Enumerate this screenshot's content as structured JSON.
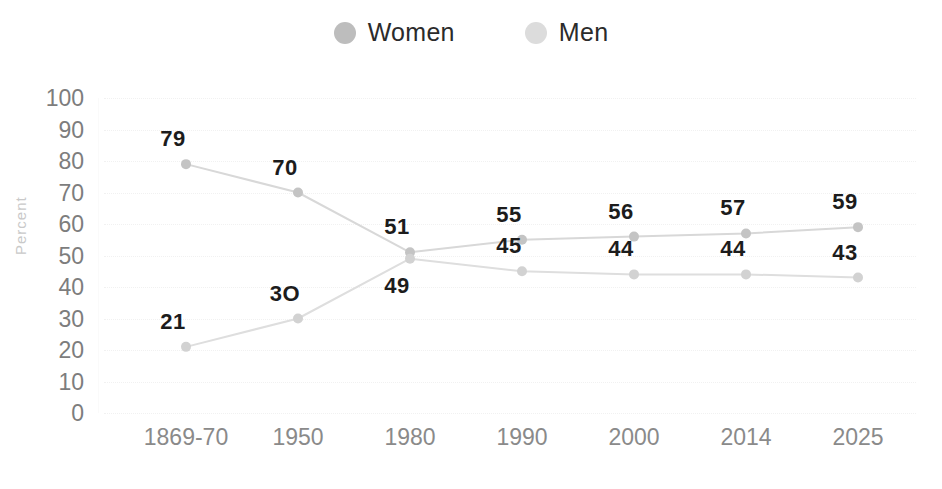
{
  "chart_data": {
    "type": "line",
    "title": "",
    "xlabel": "",
    "ylabel": "Percent",
    "ylim": [
      0,
      100
    ],
    "ytick_step": 10,
    "yticks": [
      "100",
      "90",
      "80",
      "70",
      "60",
      "50",
      "40",
      "30",
      "20",
      "10",
      "0"
    ],
    "categories": [
      "1869-70",
      "1950",
      "1980",
      "1990",
      "2000",
      "2014",
      "2025"
    ],
    "grid": "horizontal-dotted",
    "legend_position": "top-center",
    "series": [
      {
        "name": "Women",
        "color": "#bdbdbd",
        "marker_color": "#c4c4c4",
        "line_color": "#d8d8d8",
        "values": [
          79,
          70,
          51,
          55,
          56,
          57,
          59
        ],
        "labels": [
          "79",
          "70",
          "51",
          "55",
          "56",
          "57",
          "59"
        ],
        "label_side": [
          "above",
          "above",
          "above",
          "above",
          "above",
          "above",
          "above"
        ]
      },
      {
        "name": "Men",
        "color": "#dcdcdc",
        "marker_color": "#d2d2d2",
        "line_color": "#dedede",
        "values": [
          21,
          30,
          49,
          45,
          44,
          44,
          43
        ],
        "labels": [
          "21",
          "3O",
          "49",
          "45",
          "44",
          "44",
          "43"
        ],
        "label_side": [
          "above",
          "above",
          "below",
          "above",
          "above",
          "above",
          "above"
        ]
      }
    ]
  },
  "legend": {
    "items": [
      {
        "label": "Women",
        "swatch_color": "#bdbdbd"
      },
      {
        "label": "Men",
        "swatch_color": "#dcdcdc"
      }
    ]
  },
  "axes": {
    "y_title": "Percent"
  }
}
